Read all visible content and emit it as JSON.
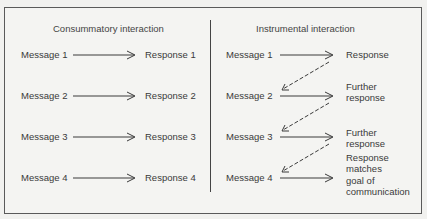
{
  "diagram": {
    "left_panel": {
      "title": "Consummatory interaction",
      "rows": [
        {
          "message": "Message  1",
          "response": "Response  1"
        },
        {
          "message": "Message  2",
          "response": "Response  2"
        },
        {
          "message": "Message  3",
          "response": "Response  3"
        },
        {
          "message": "Message  4",
          "response": "Response  4"
        }
      ]
    },
    "right_panel": {
      "title": "Instrumental  interaction",
      "rows": [
        {
          "message": "Message  1",
          "response_lines": [
            "Response"
          ]
        },
        {
          "message": "Message  2",
          "response_lines": [
            "Further",
            "response"
          ]
        },
        {
          "message": "Message  3",
          "response_lines": [
            "Further",
            "response"
          ]
        },
        {
          "message": "Message  4",
          "response_lines": [
            "Response",
            "matches",
            "goal of",
            "communication"
          ]
        }
      ],
      "feedback_arrows": "dashed arrows from each response back to the next message"
    },
    "colors": {
      "line": "#3a3a3a",
      "background": "#f1f1ef"
    }
  }
}
